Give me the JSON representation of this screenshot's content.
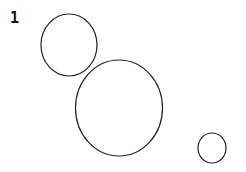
{
  "diagram": {
    "label": "1",
    "stroke_color": "#222222",
    "circles": [
      {
        "cx": 69,
        "cy": 45,
        "rx": 28,
        "ry": 31
      },
      {
        "cx": 119,
        "cy": 108,
        "rx": 43.5,
        "ry": 48
      },
      {
        "cx": 212,
        "cy": 148,
        "rx": 14,
        "ry": 15
      }
    ]
  }
}
